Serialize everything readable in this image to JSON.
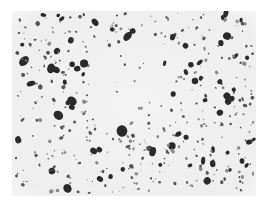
{
  "image": {
    "kind": "micrograph",
    "description": "Grayscale photomicrograph showing dark irregular particles dispersed in a light matrix",
    "colors": {
      "background": "#ffffff",
      "matrix": "#f1f1f1",
      "particle_dark": "#2b2b2b",
      "particle_mid": "#555555",
      "particle_light": "#8a8a8a"
    }
  }
}
